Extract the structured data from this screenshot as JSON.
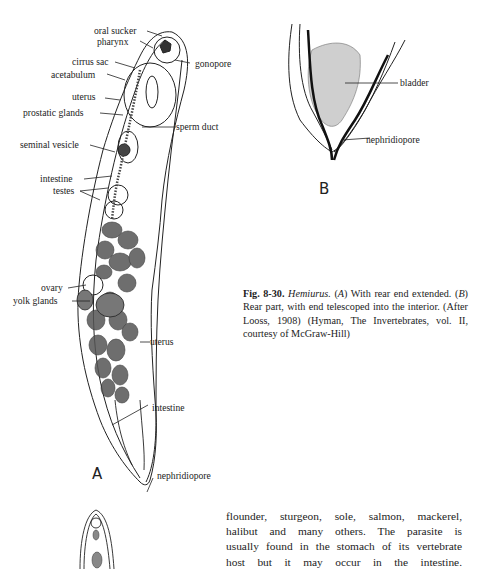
{
  "figure": {
    "panel_a": {
      "letter": "A",
      "labels": [
        {
          "id": "oral-sucker",
          "text": "oral sucker"
        },
        {
          "id": "pharynx",
          "text": "pharynx"
        },
        {
          "id": "cirrus-sac",
          "text": "cirrus sac"
        },
        {
          "id": "gonopore",
          "text": "gonopore"
        },
        {
          "id": "acetabulum",
          "text": "acetabulum"
        },
        {
          "id": "uterus-upper",
          "text": "uterus"
        },
        {
          "id": "prostatic-glands",
          "text": "prostatic glands"
        },
        {
          "id": "sperm-duct",
          "text": "sperm duct"
        },
        {
          "id": "seminal-vesicle",
          "text": "seminal vesicle"
        },
        {
          "id": "intestine-upper",
          "text": "intestine"
        },
        {
          "id": "testes",
          "text": "testes"
        },
        {
          "id": "ovary",
          "text": "ovary"
        },
        {
          "id": "yolk-glands",
          "text": "yolk glands"
        },
        {
          "id": "uterus-lower",
          "text": "uterus"
        },
        {
          "id": "intestine-lower",
          "text": "intestine"
        },
        {
          "id": "nephridiopore-a",
          "text": "nephridiopore"
        }
      ]
    },
    "panel_b": {
      "letter": "B",
      "labels": [
        {
          "id": "bladder",
          "text": "bladder"
        },
        {
          "id": "nephridiopore-b",
          "text": "nephridiopore"
        }
      ]
    },
    "caption": {
      "fig_number": "Fig. 8-30.",
      "genus": "Hemiurus.",
      "part1": " (",
      "a": "A",
      "part2": ") With rear end extended. (",
      "b": "B",
      "part3": ") Rear part, with end telescoped into the interior. (After Looss, 1908) (Hyman, The Invertebrates, vol. II, courtesy of McGraw-Hill)"
    }
  },
  "body_text": {
    "lines": [
      "flounder, sturgeon, sole, salmon, mackerel,",
      "halibut and many others. The parasite is",
      "usually found in the stomach of its vertebrate",
      "host but it may occur in the intestine."
    ]
  }
}
